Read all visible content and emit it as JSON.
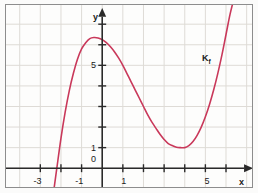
{
  "figure": {
    "background_color": "#fbfbfa",
    "frame_color": "#8d8d8d",
    "grid_color": "#dedbd6",
    "axis_color": "#2a2a2a"
  },
  "labels": {
    "x_axis_name": "x",
    "y_axis_name": "y",
    "curve_label_main": "K",
    "curve_label_sub": "f",
    "origin_label": "0"
  },
  "chart_data": {
    "type": "line",
    "title": "",
    "xlabel": "x",
    "ylabel": "y",
    "curve_name": "K_f",
    "curve_color": "#c9385a",
    "grid": true,
    "legend": "none",
    "xlim": [
      -3.9,
      6.9
    ],
    "ylim": [
      -1.1,
      7.9
    ],
    "x_ticks": [
      -3,
      -2,
      -1,
      1,
      2,
      3,
      4,
      5,
      6
    ],
    "x_tick_labels": [
      "-3",
      "",
      "-1",
      "1",
      "",
      "",
      "",
      "5",
      ""
    ],
    "y_ticks": [
      1,
      2,
      3,
      4,
      5,
      6,
      7
    ],
    "y_tick_labels": [
      "1",
      "",
      "",
      "",
      "5",
      "",
      ""
    ],
    "origin_tick_label": "0",
    "features": {
      "x_intercept": -2.2,
      "local_maximum": {
        "x": -0.1,
        "y": 6.3
      },
      "local_minimum": {
        "x": 4.0,
        "y": 1.0
      },
      "y_intercept": 6.3
    },
    "x": [
      -2.35,
      -2.2,
      -2.0,
      -1.8,
      -1.6,
      -1.4,
      -1.2,
      -1.0,
      -0.8,
      -0.6,
      -0.4,
      -0.2,
      0.0,
      0.2,
      0.4,
      0.6,
      0.8,
      1.0,
      1.2,
      1.4,
      1.6,
      1.8,
      2.0,
      2.2,
      2.4,
      2.6,
      2.8,
      3.0,
      3.2,
      3.4,
      3.6,
      3.8,
      4.0,
      4.2,
      4.4,
      4.6,
      4.8,
      5.0,
      5.2,
      5.4,
      5.6,
      5.8,
      6.0,
      6.2,
      6.4
    ],
    "y": [
      -1.1,
      0.0,
      1.45,
      2.7,
      3.75,
      4.6,
      5.3,
      5.8,
      6.1,
      6.3,
      6.35,
      6.33,
      6.25,
      6.1,
      5.9,
      5.65,
      5.35,
      5.0,
      4.6,
      4.2,
      3.8,
      3.4,
      3.0,
      2.6,
      2.25,
      1.95,
      1.65,
      1.4,
      1.2,
      1.1,
      1.02,
      1.0,
      1.0,
      1.1,
      1.3,
      1.6,
      2.0,
      2.5,
      3.1,
      3.8,
      4.6,
      5.5,
      6.5,
      7.5,
      8.3
    ]
  },
  "geometry": {
    "origin_px": {
      "x": 103,
      "y": 170
    },
    "unit_px": 20.8
  }
}
